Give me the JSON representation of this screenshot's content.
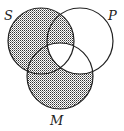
{
  "diagram": {
    "type": "venn",
    "labels": {
      "s": "S",
      "p": "P",
      "m": "M"
    },
    "circles": [
      {
        "name": "S",
        "cx": 41,
        "cy": 41,
        "r": 33
      },
      {
        "name": "P",
        "cx": 80,
        "cy": 41,
        "r": 33
      },
      {
        "name": "M",
        "cx": 60,
        "cy": 76,
        "r": 33
      }
    ],
    "shaded_regions": [
      "S only",
      "S and P not M",
      "S and M not P",
      "M only"
    ],
    "unshaded_regions": [
      "P only",
      "P and M not S",
      "S and P and M"
    ],
    "colors": {
      "stroke": "#222222",
      "hatch": "#333333",
      "background": "#ffffff"
    }
  }
}
